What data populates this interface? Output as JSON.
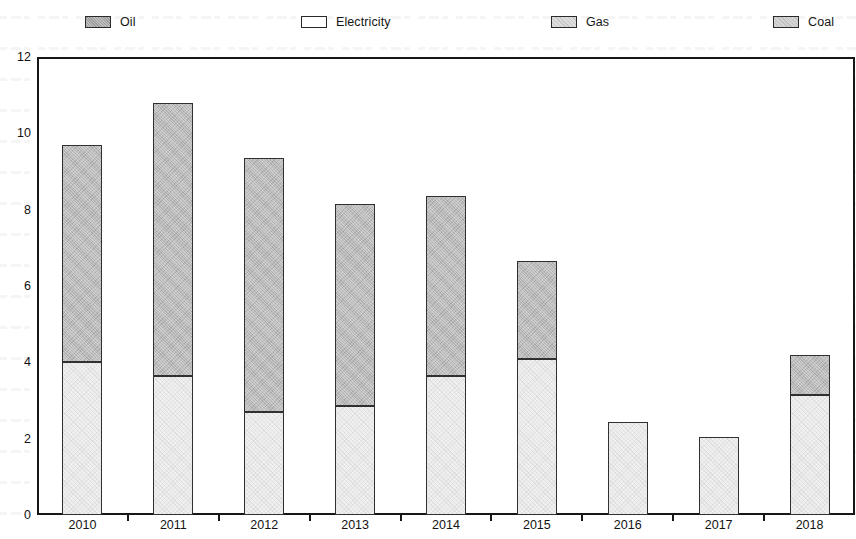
{
  "chart_data": {
    "type": "bar",
    "stacked": true,
    "title": "",
    "xlabel": "",
    "ylabel": "",
    "ylim": [
      0,
      12
    ],
    "ytick_step": 2,
    "yticks": [
      "0",
      "2",
      "4",
      "6",
      "8",
      "10",
      "12"
    ],
    "grid": false,
    "legend_position": "top",
    "categories": [
      "2010",
      "2011",
      "2012",
      "2013",
      "2014",
      "2015",
      "2016",
      "2017",
      "2018"
    ],
    "series": [
      {
        "name": "Electricity",
        "color": "#f0f0f0",
        "values": [
          4.0,
          3.65,
          2.7,
          2.85,
          3.65,
          4.1,
          2.45,
          2.05,
          3.15
        ]
      },
      {
        "name": "Oil",
        "color": "#b9b9b9",
        "values": [
          5.7,
          7.15,
          6.65,
          5.3,
          4.7,
          2.55,
          0,
          0,
          1.05
        ]
      }
    ],
    "totals": [
      9.7,
      10.8,
      9.35,
      8.15,
      8.35,
      6.65,
      2.45,
      2.05,
      4.2
    ]
  },
  "legend": {
    "items": [
      {
        "label": "Oil",
        "swatch": "oil",
        "x": 85
      },
      {
        "label": "Electricity",
        "swatch": "electricity",
        "x": 301
      },
      {
        "label": "Gas",
        "swatch": "gas",
        "x": 551
      },
      {
        "label": "Coal",
        "swatch": "coal",
        "x": 773
      }
    ]
  }
}
